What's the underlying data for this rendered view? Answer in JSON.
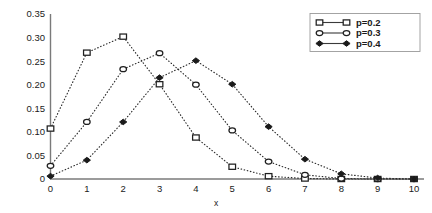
{
  "chart_data": {
    "type": "line",
    "title": "",
    "xlabel": "x",
    "ylabel": "",
    "x": [
      0,
      1,
      2,
      3,
      4,
      5,
      6,
      7,
      8,
      9,
      10
    ],
    "xlim": [
      0,
      10
    ],
    "ylim": [
      0,
      0.35
    ],
    "grid": false,
    "legend_position": "top-right",
    "xticks": [
      "0",
      "1",
      "2",
      "3",
      "4",
      "5",
      "6",
      "7",
      "8",
      "9",
      "10"
    ],
    "yticks": [
      "0",
      "0.05",
      "0.10",
      "0.15",
      "0.20",
      "0.25",
      "0.30",
      "0.35"
    ],
    "ytick_values": [
      0,
      0.05,
      0.1,
      0.15,
      0.2,
      0.25,
      0.3,
      0.35
    ],
    "series": [
      {
        "name": "p=0.2",
        "marker": "open-square",
        "linestyle": "dotted",
        "values": [
          0.107,
          0.268,
          0.302,
          0.201,
          0.088,
          0.026,
          0.006,
          0.001,
          0.0,
          0.0,
          0.0
        ]
      },
      {
        "name": "p=0.3",
        "marker": "open-circle",
        "linestyle": "dotted",
        "values": [
          0.028,
          0.121,
          0.233,
          0.267,
          0.2,
          0.103,
          0.037,
          0.009,
          0.001,
          0.0,
          0.0
        ]
      },
      {
        "name": "p=0.4",
        "marker": "solid-diamond",
        "linestyle": "dotted",
        "values": [
          0.006,
          0.04,
          0.121,
          0.215,
          0.251,
          0.201,
          0.111,
          0.042,
          0.011,
          0.002,
          0.0
        ]
      }
    ]
  },
  "legend": {
    "entries": [
      {
        "label": "p=0.2"
      },
      {
        "label": "p=0.3"
      },
      {
        "label": "p=0.4"
      }
    ]
  },
  "axes": {
    "x_axis_label": "x"
  }
}
